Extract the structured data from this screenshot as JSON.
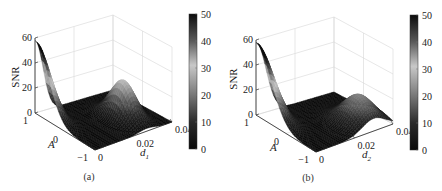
{
  "chart_data": [
    {
      "panel": "a",
      "type": "surface3d",
      "caption": "(a)",
      "title": "",
      "zlabel": "SNR",
      "xlabel": "A",
      "ylabel": "d",
      "ylabel_subscript": "1",
      "x_range": [
        -1,
        1
      ],
      "y_range": [
        0,
        0.04
      ],
      "zlim": [
        0,
        60
      ],
      "x_ticks": [
        "1",
        "0",
        "−1"
      ],
      "y_ticks": [
        "0",
        "0.02",
        "0.04"
      ],
      "z_ticks": [
        "0",
        "20",
        "40",
        "60"
      ],
      "grid": true,
      "colormap": "gray-reversed",
      "colorbar": {
        "range": [
          0,
          50
        ],
        "ticks": [
          "0",
          "10",
          "20",
          "30",
          "40",
          "50"
        ]
      },
      "peaks": [
        {
          "A": 1.0,
          "d": 0.0,
          "SNR": 58,
          "width_A": 0.45,
          "width_d": 0.004
        },
        {
          "A": -0.2,
          "d": 0.027,
          "SNR": 30,
          "width_A": 0.35,
          "width_d": 0.004
        }
      ]
    },
    {
      "panel": "b",
      "type": "surface3d",
      "caption": "(b)",
      "title": "",
      "zlabel": "SNR",
      "xlabel": "A",
      "ylabel": "d",
      "ylabel_subscript": "2",
      "x_range": [
        -1,
        1
      ],
      "y_range": [
        0,
        0.04
      ],
      "zlim": [
        0,
        60
      ],
      "x_ticks": [
        "1",
        "0",
        "−1"
      ],
      "y_ticks": [
        "0",
        "0.02",
        "0.04"
      ],
      "z_ticks": [
        "0",
        "20",
        "40",
        "60"
      ],
      "grid": true,
      "colormap": "gray-reversed",
      "colorbar": {
        "range": [
          0,
          50
        ],
        "ticks": [
          "0",
          "10",
          "20",
          "30",
          "40",
          "50"
        ]
      },
      "peaks": [
        {
          "A": 1.0,
          "d": 0.0,
          "SNR": 58,
          "width_A": 0.5,
          "width_d": 0.005
        },
        {
          "A": -0.5,
          "d": 0.03,
          "SNR": 22,
          "width_A": 0.4,
          "width_d": 0.006
        }
      ]
    }
  ]
}
